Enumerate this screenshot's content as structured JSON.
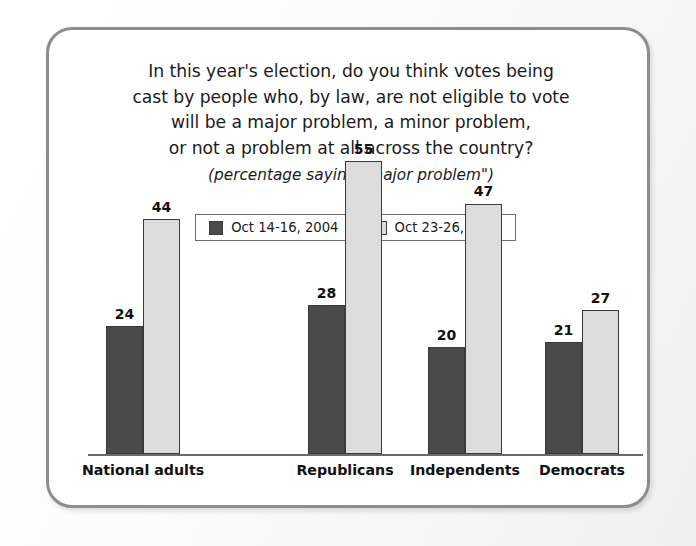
{
  "chart_data": {
    "type": "bar",
    "title_lines": [
      "In this year's election, do you think votes being",
      "cast by people who, by law, are not eligible to vote",
      "will be a major problem, a minor problem,",
      "or not a problem at all across the country?"
    ],
    "subtitle": "(percentage saying \"major problem\")",
    "categories": [
      "National adults",
      "Republicans",
      "Independents",
      "Democrats"
    ],
    "series": [
      {
        "name": "Oct 14-16, 2004",
        "color": "#4a4a4a",
        "values": [
          24,
          28,
          20,
          21
        ]
      },
      {
        "name": "Oct 23-26, 2008",
        "color": "#dcdcdc",
        "values": [
          44,
          55,
          47,
          27
        ]
      }
    ],
    "xlabel": "",
    "ylabel": "",
    "ylim": [
      0,
      70
    ],
    "grid": false,
    "legend_position": "top-center",
    "value_labels": true
  },
  "legend": {
    "items": [
      {
        "label": "Oct 14-16, 2004",
        "swatch": "#4a4a4a"
      },
      {
        "label": "Oct 23-26, 2008",
        "swatch": "#dcdcdc"
      }
    ]
  },
  "colors": {
    "series_2004": "#4a4a4a",
    "series_2008": "#dcdcdc",
    "frame_border": "#8d8d8d",
    "axis": "#6a6a6a",
    "text": "#1b1b1b"
  }
}
